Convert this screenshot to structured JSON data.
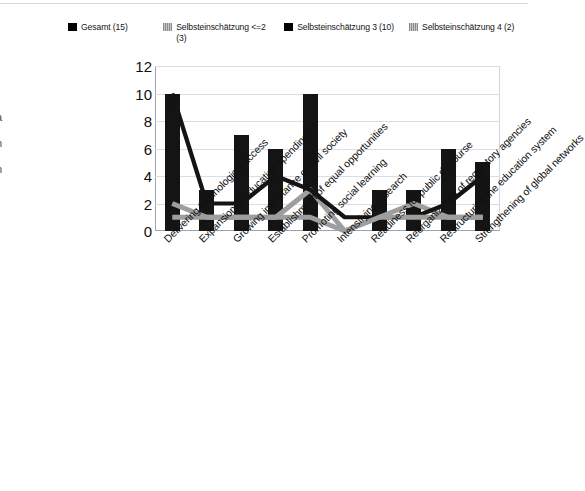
{
  "page_bleed": [
    "l",
    "•",
    "•",
    ":",
    "a",
    "n",
    "n",
    "t"
  ],
  "legend": {
    "items": [
      {
        "label": "Gesamt (15)",
        "swatch": "solid-black-swatch",
        "color": "#000000"
      },
      {
        "label": "Selbsteinschätzung <=2 (3)",
        "swatch": "hatched-gray-swatch",
        "color": "#9e9e9e"
      },
      {
        "label": "Selbsteinschätzung 3 (10)",
        "swatch": "solid-black-swatch",
        "color": "#000000"
      },
      {
        "label": "Selbsteinschätzung 4 (2)",
        "swatch": "hatched-gray-swatch",
        "color": "#9e9e9e"
      }
    ]
  },
  "chart_data": {
    "type": "bar",
    "title": "",
    "subtitle": "",
    "xlabel": "",
    "ylabel": "",
    "ylim": [
      0,
      12
    ],
    "yticks": [
      0,
      2,
      4,
      6,
      8,
      10,
      12
    ],
    "grid": true,
    "legend_position": "top",
    "categories": [
      "Delivering technological access",
      "Expansion of education spending",
      "Growing importance of civil society",
      "Establishment of equal opportunities",
      "Promoting social learning",
      "Intensifying research",
      "Readiness for public discourse",
      "Reorganization of regulatory agencies",
      "Restructuring the education system",
      "Strengthening of global networks"
    ],
    "series": [
      {
        "name": "Gesamt (15)",
        "render": "bar",
        "color": "#141414",
        "values": [
          10,
          3,
          7,
          6,
          10,
          0,
          3,
          3,
          6,
          5
        ]
      },
      {
        "name": "Selbsteinschätzung <=2 (3)",
        "render": "line",
        "color": "#9e9e9e",
        "values": [
          2,
          1,
          1,
          1,
          3,
          0,
          1,
          2,
          1,
          1
        ]
      },
      {
        "name": "Selbsteinschätzung 3 (10)",
        "render": "line",
        "color": "#141414",
        "values": [
          10,
          2,
          2,
          4,
          3,
          1,
          1,
          1,
          2,
          4
        ]
      },
      {
        "name": "Selbsteinschätzung 4 (2)",
        "render": "line",
        "color": "#9e9e9e",
        "values": [
          1,
          1,
          1,
          1,
          1,
          0,
          1,
          1,
          1,
          1
        ]
      }
    ]
  }
}
